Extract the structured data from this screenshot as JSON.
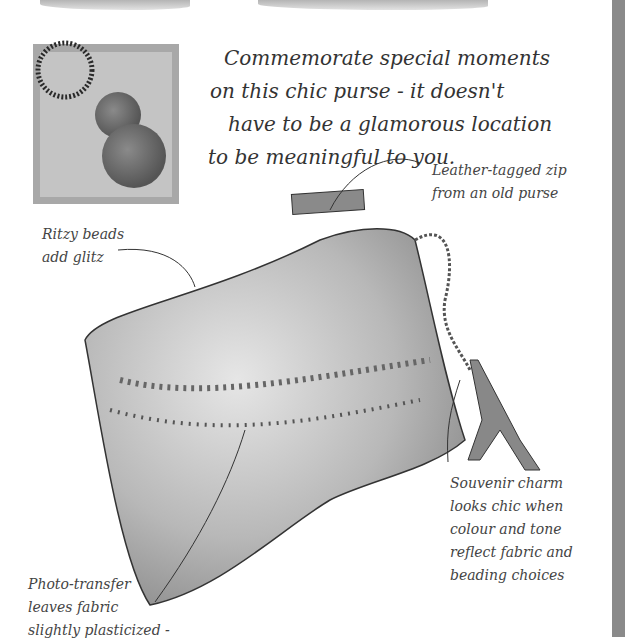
{
  "intro": {
    "lines": [
      "Commemorate special moments",
      "on this chic purse - it doesn't",
      "have to be a glamorous location",
      "to be meaningful to you."
    ]
  },
  "callouts": {
    "zip": {
      "lines": [
        "Leather-tagged zip",
        "from an old purse"
      ]
    },
    "beads": {
      "lines": [
        "Ritzy beads",
        "add glitz"
      ]
    },
    "charm": {
      "lines": [
        "Souvenir charm",
        "looks chic when",
        "colour and tone",
        "reflect fabric and",
        "beading choices"
      ]
    },
    "photo": {
      "lines": [
        "Photo-transfer",
        "leaves fabric",
        "slightly plasticized -"
      ]
    }
  },
  "colors": {
    "ink": "#333333",
    "purse_dark": "#7a7a7a",
    "purse_light": "#d6d6d6",
    "edge": "#8a8a8a"
  }
}
